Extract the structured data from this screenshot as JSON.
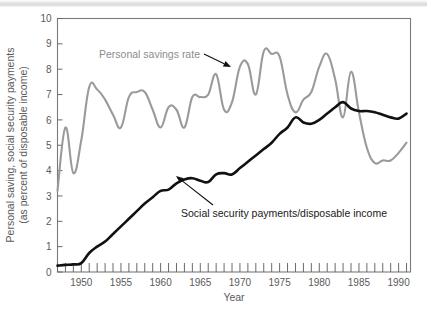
{
  "figure": {
    "name": "personal-saving-vs-social-security-chart",
    "background_color": "#ffffff",
    "top_band_color": "#dcdcdc"
  },
  "chart_data": {
    "type": "line",
    "title": "",
    "subtitle": "",
    "xlabel": "Year",
    "ylabel": "Personal saving, social security payments (as percent of disposable income)",
    "ylabel_line1": "Personal saving, social security payments",
    "ylabel_line2": "(as percent of disposable income)",
    "xlim": [
      1947,
      1991.5
    ],
    "ylim": [
      0,
      10
    ],
    "ytick_values": [
      0,
      1,
      2,
      3,
      4,
      5,
      6,
      7,
      8,
      9,
      10
    ],
    "ytick_labels": [
      "0",
      "1",
      "2",
      "3",
      "4",
      "5",
      "6",
      "7",
      "8",
      "9",
      "10"
    ],
    "xtick_major_values": [
      1950,
      1955,
      1960,
      1965,
      1970,
      1975,
      1980,
      1985,
      1990
    ],
    "xtick_major_labels": [
      "1950",
      "1955",
      "1960",
      "1965",
      "1970",
      "1975",
      "1980",
      "1985",
      "1990"
    ],
    "xtick_minor_step": 1,
    "grid": false,
    "legend_position": "inline-annotations",
    "series": [
      {
        "name": "Personal savings rate",
        "color": "#9a9a9a",
        "x": [
          1947,
          1948,
          1949,
          1950,
          1951,
          1952,
          1953,
          1954,
          1955,
          1956,
          1957,
          1958,
          1959,
          1960,
          1961,
          1962,
          1963,
          1964,
          1965,
          1966,
          1967,
          1968,
          1969,
          1970,
          1971,
          1972,
          1973,
          1974,
          1975,
          1976,
          1977,
          1978,
          1979,
          1980,
          1981,
          1982,
          1983,
          1984,
          1985,
          1986,
          1987,
          1988,
          1989,
          1990,
          1991
        ],
        "values": [
          3.2,
          5.7,
          3.9,
          5.2,
          7.3,
          7.2,
          6.8,
          6.2,
          5.7,
          6.9,
          7.1,
          7.1,
          6.4,
          5.7,
          6.5,
          6.4,
          5.7,
          6.9,
          6.9,
          7.0,
          7.8,
          6.4,
          6.7,
          8.1,
          8.2,
          7.0,
          8.7,
          8.6,
          8.5,
          7.0,
          6.3,
          6.8,
          7.1,
          8.1,
          8.6,
          7.6,
          6.1,
          7.9,
          6.3,
          4.9,
          4.3,
          4.4,
          4.4,
          4.7,
          5.1
        ]
      },
      {
        "name": "Social security payments/disposable income",
        "color": "#111111",
        "x": [
          1947,
          1948,
          1949,
          1950,
          1951,
          1952,
          1953,
          1954,
          1955,
          1956,
          1957,
          1958,
          1959,
          1960,
          1961,
          1962,
          1963,
          1964,
          1965,
          1966,
          1967,
          1968,
          1969,
          1970,
          1971,
          1972,
          1973,
          1974,
          1975,
          1976,
          1977,
          1978,
          1979,
          1980,
          1981,
          1982,
          1983,
          1984,
          1985,
          1986,
          1987,
          1988,
          1989,
          1990,
          1991
        ],
        "values": [
          0.25,
          0.28,
          0.3,
          0.35,
          0.75,
          1.0,
          1.2,
          1.5,
          1.8,
          2.1,
          2.4,
          2.7,
          2.95,
          3.2,
          3.25,
          3.5,
          3.65,
          3.7,
          3.6,
          3.55,
          3.85,
          3.9,
          3.85,
          4.1,
          4.35,
          4.6,
          4.85,
          5.1,
          5.45,
          5.7,
          6.1,
          5.9,
          5.85,
          6.0,
          6.25,
          6.5,
          6.7,
          6.45,
          6.35,
          6.35,
          6.3,
          6.2,
          6.1,
          6.05,
          6.25
        ]
      }
    ],
    "annotations": [
      {
        "name": "personal-savings-rate-annotation",
        "text": "Personal savings rate",
        "color": "#8c8c8c",
        "text_x": 99,
        "text_y": 58,
        "arrow_from_x": 204,
        "arrow_from_y": 54,
        "arrow_to_x": 231,
        "arrow_to_y": 67
      },
      {
        "name": "social-security-payments-annotation",
        "text": "Social security payments/disposable income",
        "color": "#1a1a1a",
        "text_x": 181,
        "text_y": 217,
        "arrow_from_x": 213,
        "arrow_from_y": 205,
        "arrow_to_x": 176,
        "arrow_to_y": 176
      }
    ]
  }
}
